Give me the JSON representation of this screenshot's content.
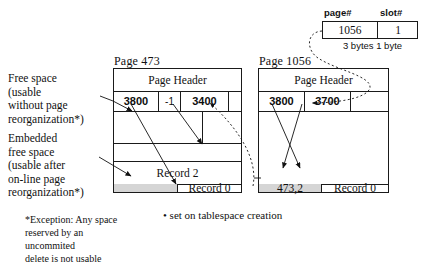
{
  "pointer_table": {
    "header_page": "page#",
    "header_slot": "slot#",
    "value_page": "1056",
    "value_slot": "1",
    "bytes_label": "3 bytes 1 byte"
  },
  "page_left": {
    "title": "Page  473",
    "header_label": "Page Header",
    "slots": [
      "3800",
      "-1",
      "3400"
    ],
    "records": [
      {
        "label": "Record  2"
      },
      {
        "label": "Record  0"
      }
    ],
    "embedded_free_cell": ""
  },
  "page_right": {
    "title": "Page  1056",
    "header_label": "Page Header",
    "slots": [
      "3800",
      "3700"
    ],
    "records": [
      {
        "label": "Record  0"
      }
    ],
    "forward_pointer_cell": "473,2"
  },
  "annotations": {
    "free_space": "Free space\n(usable\nwithout page\nreorganization*)",
    "embedded_free_space": "Embedded\nfree space\n(usable after\non-line page\nreorganization*)",
    "exception": "*Exception: Any space\nreserved by an\nuncommited\ndelete is not usable",
    "bullet_note": "• set on tablespace creation"
  },
  "colors": {
    "line": "#1a1a1a",
    "shade": "#d5d5d5",
    "text": "#111111"
  }
}
